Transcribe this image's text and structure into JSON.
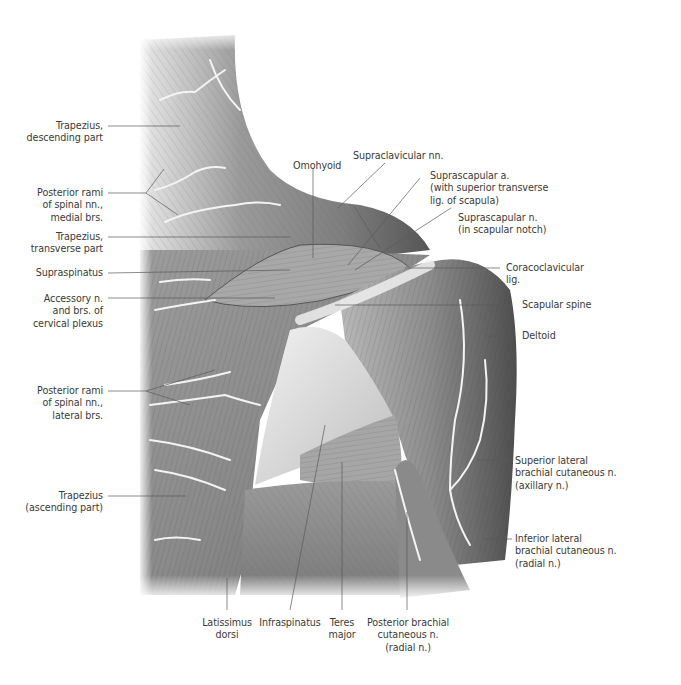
{
  "figure": {
    "background": "#ffffff",
    "line_color": "#5a5a5a",
    "text_color": "#3a3a3a"
  },
  "labels": {
    "trapezius_descending": "Trapezius,\ndescending part",
    "posterior_rami_medial": "Posterior rami\nof spinal nn.,\nmedial brs.",
    "trapezius_transverse": "Trapezius,\ntransverse part",
    "supraspinatus": "Supraspinatus",
    "accessory_n": "Accessory n.\nand brs. of\ncervical plexus",
    "posterior_rami_lateral": "Posterior rami\nof spinal nn.,\nlateral brs.",
    "trapezius_ascending": "Trapezius\n(ascending part)",
    "omohyoid": "Omohyoid",
    "supraclavicular_nn": "Supraclavicular nn.",
    "suprascapular_a": "Suprascapular a.\n(with superior transverse\nlig. of scapula)",
    "suprascapular_n": "Suprascapular n.\n(in scapular notch)",
    "coracoclavicular_lig": "Coracoclavicular\nlig.",
    "scapular_spine": "Scapular spine",
    "deltoid": "Deltoid",
    "superior_lateral_brachial": "Superior lateral\nbrachial cutaneous n.\n(axillary n.)",
    "inferior_lateral_brachial": "Inferior lateral\nbrachial cutaneous n.\n(radial n.)",
    "latissimus_dorsi": "Latissimus\ndorsi",
    "infraspinatus": "Infraspinatus",
    "teres_major": "Teres\nmajor",
    "posterior_brachial": "Posterior brachial\ncutaneous n.\n(radial n.)"
  }
}
